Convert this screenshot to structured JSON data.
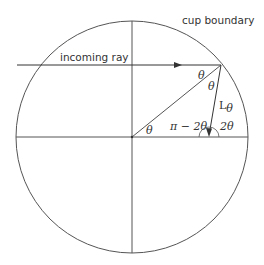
{
  "labels": {
    "cup_boundary": "cup boundary",
    "incoming_ray": "incoming ray",
    "theta_reflect_upper": "θ",
    "theta_reflect_lower": "θ",
    "theta_center": "θ",
    "L_theta_main": "L",
    "L_theta_sub": "θ",
    "pi_minus_2theta": "π − 2θ",
    "two_theta": "2θ"
  },
  "geometry": {
    "circle_center": [
      132,
      137
    ],
    "circle_radius": 116,
    "reflection_point": [
      221,
      65
    ],
    "reflected_end": [
      209,
      137
    ],
    "incoming_start": [
      17,
      65
    ]
  },
  "colors": {
    "stroke": "#555555",
    "text": "#333333"
  }
}
